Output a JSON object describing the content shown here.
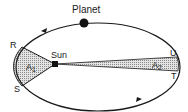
{
  "diagram": {
    "labels": {
      "planet": "Planet",
      "sun": "Sun",
      "point_r": "R",
      "point_s": "S",
      "point_u": "U",
      "point_t": "T",
      "area1": "A",
      "area1_sub": "1",
      "area2": "A",
      "area2_sub": "2"
    },
    "colors": {
      "line": "#1a1a1a",
      "shade": "#c9c9c9",
      "background": "#ffffff"
    }
  }
}
